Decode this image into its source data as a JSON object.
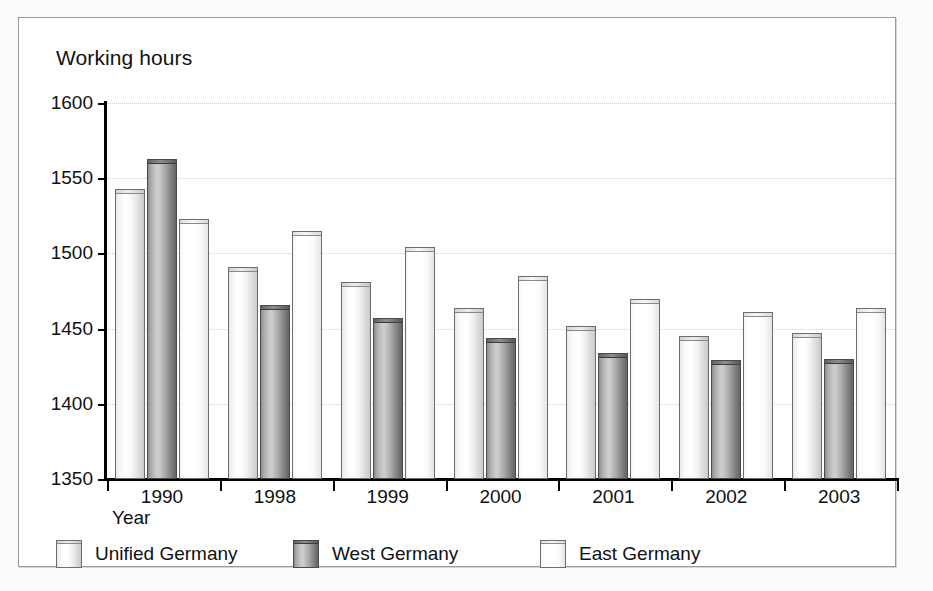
{
  "chart_data": {
    "type": "bar",
    "title": "Working hours",
    "xlabel": "Year",
    "ylabel": "Working hours",
    "categories": [
      "1990",
      "1998",
      "1999",
      "2000",
      "2001",
      "2002",
      "2003"
    ],
    "series": [
      {
        "name": "Unified Germany",
        "color": "#f0f0f0",
        "values": [
          1543,
          1491,
          1481,
          1464,
          1452,
          1445,
          1447
        ]
      },
      {
        "name": "West Germany",
        "color": "#a0a0a0",
        "values": [
          1563,
          1466,
          1457,
          1444,
          1434,
          1429,
          1430
        ]
      },
      {
        "name": "East Germany",
        "color": "#ffffff",
        "values": [
          1523,
          1515,
          1504,
          1485,
          1470,
          1461,
          1464
        ]
      }
    ],
    "ylim": [
      1350,
      1600
    ],
    "ytick_step": 50,
    "yticks": [
      "1600",
      "1550",
      "1500",
      "1450",
      "1400",
      "1350"
    ],
    "grid": true,
    "legend_position": "bottom"
  },
  "legend": {
    "items": [
      {
        "label": "Unified Germany"
      },
      {
        "label": "West Germany"
      },
      {
        "label": "East Germany"
      }
    ]
  }
}
